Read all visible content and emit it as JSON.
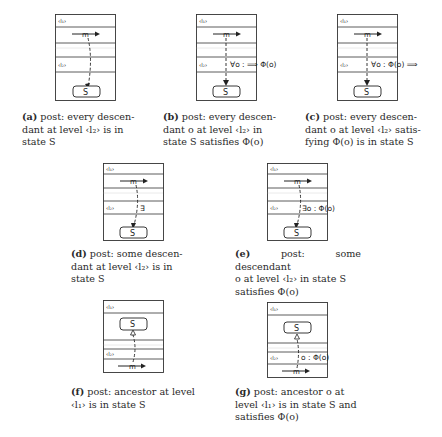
{
  "figures": [
    {
      "id": "a",
      "tag": "(a)",
      "caption": "post: every descendant at level ‹l2› is in state S",
      "caption_lines": [
        "post:  every descen-",
        "dant  at  level  ‹l₂›  is  in",
        "state S"
      ],
      "level_top": "‹l₁›",
      "level_bottom": "‹l₂›",
      "message": "m",
      "state": "S",
      "annotation": ""
    },
    {
      "id": "b",
      "tag": "(b)",
      "caption": "post: every descendant o at level ‹l2› in state S satisfies Φ(o)",
      "caption_lines": [
        "post:  every descen-",
        "dant  o  at  level  ‹l₂›  in",
        "state S satisfies Φ(o)"
      ],
      "level_top": "‹l₁›",
      "level_bottom": "‹l₂›",
      "message": "m",
      "state": "S",
      "annotation": "∀o : ⟹ Φ(o)"
    },
    {
      "id": "c",
      "tag": "(c)",
      "caption": "post: every descendant o at level ‹l2› satisfying Φ(o) is in state S",
      "caption_lines": [
        "post:  every descen-",
        "dant o at level ‹l₂› satis-",
        "fying Φ(o) is in state S"
      ],
      "level_top": "‹l₁›",
      "level_bottom": "‹l₂›",
      "message": "m",
      "state": "S",
      "annotation": "∀o : Φ(o) ⟹"
    },
    {
      "id": "d",
      "tag": "(d)",
      "caption": "post: some descendant at level ‹l2› is in state S",
      "caption_lines": [
        "post:  some  descen-",
        "dant  at  level  ‹l₂›  is  in",
        "state S"
      ],
      "level_top": "‹l₁›",
      "level_bottom": "‹l₂›",
      "message": "m",
      "state": "S",
      "annotation": "∃"
    },
    {
      "id": "e",
      "tag": "(e)",
      "caption": "post: some descendant o at level ‹l2› in state S satisfies Φ(o)",
      "caption_lines": [
        "post: some descendant",
        "o  at  level  ‹l₂›  in  state  S",
        "satisfies Φ(o)"
      ],
      "level_top": "‹l₁›",
      "level_bottom": "‹l₂›",
      "message": "m",
      "state": "S",
      "annotation": "∃o : Φ(o)"
    },
    {
      "id": "f",
      "tag": "(f)",
      "caption": "post: ancestor at level ‹l1› is in state S",
      "caption_lines": [
        "post: ancestor at level",
        "‹l₁› is in state S"
      ],
      "level_top": "‹l₁›",
      "level_bottom": "‹l₂›",
      "message": "m",
      "state": "S",
      "annotation": ""
    },
    {
      "id": "g",
      "tag": "(g)",
      "caption": "post: ancestor o at level ‹l1› is in state S and satisfies Φ(o)",
      "caption_lines": [
        "post:   ancestor  o  at",
        "level ‹l₁› is in state S and",
        "satisfies Φ(o)"
      ],
      "level_top": "‹l₁›",
      "level_bottom": "‹l₂›",
      "message": "m",
      "state": "S",
      "annotation": "o : Φ(o)"
    }
  ],
  "colors": {
    "line": "#333333",
    "text": "#222222",
    "background": "#ffffff"
  }
}
